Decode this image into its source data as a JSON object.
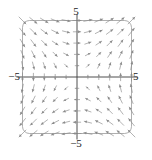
{
  "figure": {
    "kind": "vector-field-plot",
    "background_color": "#ffffff"
  },
  "labels": {
    "top": "5",
    "bottom": "−5",
    "left": "−5",
    "right": "5"
  },
  "colors": {
    "frame": "#8c8c8c",
    "axis": "#3a3a3a",
    "arrow": "#8a8a8a",
    "label": "#1a1a1a"
  },
  "chart_data": {
    "type": "scatter",
    "subtype": "quiver",
    "title": "",
    "xlabel": "",
    "ylabel": "",
    "xlim": [
      -5,
      5
    ],
    "ylim": [
      -5,
      5
    ],
    "xticks": [
      -5,
      5
    ],
    "yticks": [
      -5,
      5
    ],
    "xtick_labels": [
      "−5",
      "5"
    ],
    "ytick_labels": [
      "−5",
      "5"
    ],
    "grid": false,
    "legend": null,
    "axes_through_origin": true,
    "frame": "rounded-rectangle",
    "grid_spacing": 1,
    "grid_points_x": [
      -5,
      -4,
      -3,
      -2,
      -1,
      0,
      1,
      2,
      3,
      4,
      5
    ],
    "grid_points_y": [
      -5,
      -4,
      -3,
      -2,
      -1,
      0,
      1,
      2,
      3,
      4,
      5
    ],
    "field_u_expression": "y",
    "field_v_expression": "x",
    "normalization": "magnitude-scaled",
    "arrow_max_length_units": 0.9,
    "vectors": [
      {
        "x": -5,
        "y": 5,
        "u": 5,
        "v": -5
      },
      {
        "x": -4,
        "y": 5,
        "u": 5,
        "v": -4
      },
      {
        "x": -3,
        "y": 5,
        "u": 5,
        "v": -3
      },
      {
        "x": -2,
        "y": 5,
        "u": 5,
        "v": -2
      },
      {
        "x": -1,
        "y": 5,
        "u": 5,
        "v": -1
      },
      {
        "x": 0,
        "y": 5,
        "u": 5,
        "v": 0
      },
      {
        "x": 1,
        "y": 5,
        "u": 5,
        "v": 1
      },
      {
        "x": 2,
        "y": 5,
        "u": 5,
        "v": 2
      },
      {
        "x": 3,
        "y": 5,
        "u": 5,
        "v": 3
      },
      {
        "x": 4,
        "y": 5,
        "u": 5,
        "v": 4
      },
      {
        "x": 5,
        "y": 5,
        "u": 5,
        "v": 5
      },
      {
        "x": -5,
        "y": 4,
        "u": 4,
        "v": -5
      },
      {
        "x": -4,
        "y": 4,
        "u": 4,
        "v": -4
      },
      {
        "x": -3,
        "y": 4,
        "u": 4,
        "v": -3
      },
      {
        "x": -2,
        "y": 4,
        "u": 4,
        "v": -2
      },
      {
        "x": -1,
        "y": 4,
        "u": 4,
        "v": -1
      },
      {
        "x": 0,
        "y": 4,
        "u": 4,
        "v": 0
      },
      {
        "x": 1,
        "y": 4,
        "u": 4,
        "v": 1
      },
      {
        "x": 2,
        "y": 4,
        "u": 4,
        "v": 2
      },
      {
        "x": 3,
        "y": 4,
        "u": 4,
        "v": 3
      },
      {
        "x": 4,
        "y": 4,
        "u": 4,
        "v": 4
      },
      {
        "x": 5,
        "y": 4,
        "u": 4,
        "v": 5
      },
      {
        "x": -5,
        "y": 3,
        "u": 3,
        "v": -5
      },
      {
        "x": -4,
        "y": 3,
        "u": 3,
        "v": -4
      },
      {
        "x": -3,
        "y": 3,
        "u": 3,
        "v": -3
      },
      {
        "x": -2,
        "y": 3,
        "u": 3,
        "v": -2
      },
      {
        "x": -1,
        "y": 3,
        "u": 3,
        "v": -1
      },
      {
        "x": 0,
        "y": 3,
        "u": 3,
        "v": 0
      },
      {
        "x": 1,
        "y": 3,
        "u": 3,
        "v": 1
      },
      {
        "x": 2,
        "y": 3,
        "u": 3,
        "v": 2
      },
      {
        "x": 3,
        "y": 3,
        "u": 3,
        "v": 3
      },
      {
        "x": 4,
        "y": 3,
        "u": 3,
        "v": 4
      },
      {
        "x": 5,
        "y": 3,
        "u": 3,
        "v": 5
      },
      {
        "x": -5,
        "y": 2,
        "u": 2,
        "v": -5
      },
      {
        "x": -4,
        "y": 2,
        "u": 2,
        "v": -4
      },
      {
        "x": -3,
        "y": 2,
        "u": 2,
        "v": -3
      },
      {
        "x": -2,
        "y": 2,
        "u": 2,
        "v": -2
      },
      {
        "x": -1,
        "y": 2,
        "u": 2,
        "v": -1
      },
      {
        "x": 0,
        "y": 2,
        "u": 2,
        "v": 0
      },
      {
        "x": 1,
        "y": 2,
        "u": 2,
        "v": 1
      },
      {
        "x": 2,
        "y": 2,
        "u": 2,
        "v": 2
      },
      {
        "x": 3,
        "y": 2,
        "u": 2,
        "v": 3
      },
      {
        "x": 4,
        "y": 2,
        "u": 2,
        "v": 4
      },
      {
        "x": 5,
        "y": 2,
        "u": 2,
        "v": 5
      },
      {
        "x": -5,
        "y": 1,
        "u": 1,
        "v": -5
      },
      {
        "x": -4,
        "y": 1,
        "u": 1,
        "v": -4
      },
      {
        "x": -3,
        "y": 1,
        "u": 1,
        "v": -3
      },
      {
        "x": -2,
        "y": 1,
        "u": 1,
        "v": -2
      },
      {
        "x": -1,
        "y": 1,
        "u": 1,
        "v": -1
      },
      {
        "x": 0,
        "y": 1,
        "u": 1,
        "v": 0
      },
      {
        "x": 1,
        "y": 1,
        "u": 1,
        "v": 1
      },
      {
        "x": 2,
        "y": 1,
        "u": 1,
        "v": 2
      },
      {
        "x": 3,
        "y": 1,
        "u": 1,
        "v": 3
      },
      {
        "x": 4,
        "y": 1,
        "u": 1,
        "v": 4
      },
      {
        "x": 5,
        "y": 1,
        "u": 1,
        "v": 5
      },
      {
        "x": -5,
        "y": 0,
        "u": 0,
        "v": -5
      },
      {
        "x": -4,
        "y": 0,
        "u": 0,
        "v": -4
      },
      {
        "x": -3,
        "y": 0,
        "u": 0,
        "v": -3
      },
      {
        "x": -2,
        "y": 0,
        "u": 0,
        "v": -2
      },
      {
        "x": -1,
        "y": 0,
        "u": 0,
        "v": -1
      },
      {
        "x": 0,
        "y": 0,
        "u": 0,
        "v": 0
      },
      {
        "x": 1,
        "y": 0,
        "u": 0,
        "v": 1
      },
      {
        "x": 2,
        "y": 0,
        "u": 0,
        "v": 2
      },
      {
        "x": 3,
        "y": 0,
        "u": 0,
        "v": 3
      },
      {
        "x": 4,
        "y": 0,
        "u": 0,
        "v": 4
      },
      {
        "x": 5,
        "y": 0,
        "u": 0,
        "v": 5
      },
      {
        "x": -5,
        "y": -1,
        "u": -1,
        "v": -5
      },
      {
        "x": -4,
        "y": -1,
        "u": -1,
        "v": -4
      },
      {
        "x": -3,
        "y": -1,
        "u": -1,
        "v": -3
      },
      {
        "x": -2,
        "y": -1,
        "u": -1,
        "v": -2
      },
      {
        "x": -1,
        "y": -1,
        "u": -1,
        "v": -1
      },
      {
        "x": 0,
        "y": -1,
        "u": -1,
        "v": 0
      },
      {
        "x": 1,
        "y": -1,
        "u": -1,
        "v": 1
      },
      {
        "x": 2,
        "y": -1,
        "u": -1,
        "v": 2
      },
      {
        "x": 3,
        "y": -1,
        "u": -1,
        "v": 3
      },
      {
        "x": 4,
        "y": -1,
        "u": -1,
        "v": 4
      },
      {
        "x": 5,
        "y": -1,
        "u": -1,
        "v": 5
      },
      {
        "x": -5,
        "y": -2,
        "u": -2,
        "v": -5
      },
      {
        "x": -4,
        "y": -2,
        "u": -2,
        "v": -4
      },
      {
        "x": -3,
        "y": -2,
        "u": -2,
        "v": -3
      },
      {
        "x": -2,
        "y": -2,
        "u": -2,
        "v": -2
      },
      {
        "x": -1,
        "y": -2,
        "u": -2,
        "v": -1
      },
      {
        "x": 0,
        "y": -2,
        "u": -2,
        "v": 0
      },
      {
        "x": 1,
        "y": -2,
        "u": -2,
        "v": 1
      },
      {
        "x": 2,
        "y": -2,
        "u": -2,
        "v": 2
      },
      {
        "x": 3,
        "y": -2,
        "u": -2,
        "v": 3
      },
      {
        "x": 4,
        "y": -2,
        "u": -2,
        "v": 4
      },
      {
        "x": 5,
        "y": -2,
        "u": -2,
        "v": 5
      },
      {
        "x": -5,
        "y": -3,
        "u": -3,
        "v": -5
      },
      {
        "x": -4,
        "y": -3,
        "u": -3,
        "v": -4
      },
      {
        "x": -3,
        "y": -3,
        "u": -3,
        "v": -3
      },
      {
        "x": -2,
        "y": -3,
        "u": -3,
        "v": -2
      },
      {
        "x": -1,
        "y": -3,
        "u": -3,
        "v": -1
      },
      {
        "x": 0,
        "y": -3,
        "u": -3,
        "v": 0
      },
      {
        "x": 1,
        "y": -3,
        "u": -3,
        "v": 1
      },
      {
        "x": 2,
        "y": -3,
        "u": -3,
        "v": 2
      },
      {
        "x": 3,
        "y": -3,
        "u": -3,
        "v": 3
      },
      {
        "x": 4,
        "y": -3,
        "u": -3,
        "v": 4
      },
      {
        "x": 5,
        "y": -3,
        "u": -3,
        "v": 5
      },
      {
        "x": -5,
        "y": -4,
        "u": -4,
        "v": -5
      },
      {
        "x": -4,
        "y": -4,
        "u": -4,
        "v": -4
      },
      {
        "x": -3,
        "y": -4,
        "u": -4,
        "v": -3
      },
      {
        "x": -2,
        "y": -4,
        "u": -4,
        "v": -2
      },
      {
        "x": -1,
        "y": -4,
        "u": -4,
        "v": -1
      },
      {
        "x": 0,
        "y": -4,
        "u": -4,
        "v": 0
      },
      {
        "x": 1,
        "y": -4,
        "u": -4,
        "v": 1
      },
      {
        "x": 2,
        "y": -4,
        "u": -4,
        "v": 2
      },
      {
        "x": 3,
        "y": -4,
        "u": -4,
        "v": 3
      },
      {
        "x": 4,
        "y": -4,
        "u": -4,
        "v": 4
      },
      {
        "x": 5,
        "y": -4,
        "u": -4,
        "v": 5
      },
      {
        "x": -5,
        "y": -5,
        "u": -5,
        "v": -5
      },
      {
        "x": -4,
        "y": -5,
        "u": -5,
        "v": -4
      },
      {
        "x": -3,
        "y": -5,
        "u": -5,
        "v": -3
      },
      {
        "x": -2,
        "y": -5,
        "u": -5,
        "v": -2
      },
      {
        "x": -1,
        "y": -5,
        "u": -5,
        "v": -1
      },
      {
        "x": 0,
        "y": -5,
        "u": -5,
        "v": 0
      },
      {
        "x": 1,
        "y": -5,
        "u": -5,
        "v": 1
      },
      {
        "x": 2,
        "y": -5,
        "u": -5,
        "v": 2
      },
      {
        "x": 3,
        "y": -5,
        "u": -5,
        "v": 3
      },
      {
        "x": 4,
        "y": -5,
        "u": -5,
        "v": 4
      },
      {
        "x": 5,
        "y": -5,
        "u": -5,
        "v": 5
      }
    ]
  }
}
